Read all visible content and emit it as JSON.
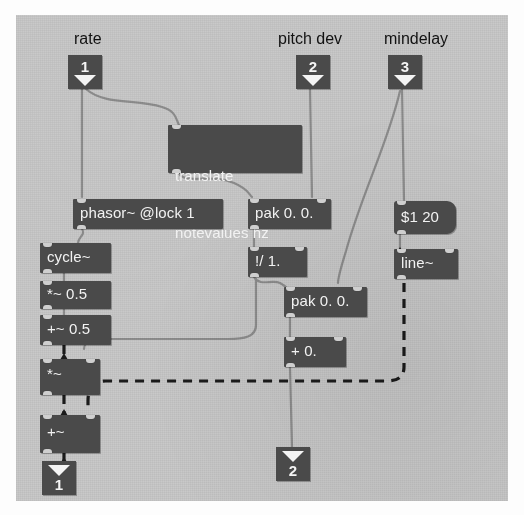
{
  "patch": {
    "title": "Max/MSP patcher",
    "canvas_color": "#c9c9c9",
    "object_color": "#4a4a4a",
    "text_color": "#f2f2f2",
    "comment_color": "#121212"
  },
  "comments": [
    {
      "name": "comment-rate",
      "text": "rate"
    },
    {
      "name": "comment-pitch-dev",
      "text": "pitch dev"
    },
    {
      "name": "comment-mindelay",
      "text": "mindelay"
    }
  ],
  "number_boxes": [
    {
      "name": "inlet-1-rate",
      "value": "1",
      "kind": "inlet"
    },
    {
      "name": "inlet-2-pitch-dev",
      "value": "2",
      "kind": "inlet"
    },
    {
      "name": "inlet-3-mindelay",
      "value": "3",
      "kind": "inlet"
    },
    {
      "name": "outlet-1",
      "value": "1",
      "kind": "outlet"
    },
    {
      "name": "outlet-2",
      "value": "2",
      "kind": "outlet"
    }
  ],
  "objects": [
    {
      "name": "object-translate-notevalues-hz",
      "line1": "translate",
      "line2": "notevalues hz",
      "kind": "object"
    },
    {
      "name": "object-phasor",
      "text": "phasor~ @lock 1",
      "kind": "object"
    },
    {
      "name": "object-pak-top",
      "text": "pak 0. 0.",
      "kind": "object"
    },
    {
      "name": "object-message-mindelay",
      "text": "$1 20",
      "kind": "message"
    },
    {
      "name": "object-cycle",
      "text": "cycle~",
      "kind": "object"
    },
    {
      "name": "object-divide-inverse",
      "text": "!/ 1.",
      "kind": "object"
    },
    {
      "name": "object-line",
      "text": "line~",
      "kind": "object"
    },
    {
      "name": "object-multiply-signal-half",
      "text": "*~ 0.5",
      "kind": "object"
    },
    {
      "name": "object-pak-bottom",
      "text": "pak 0. 0.",
      "kind": "object"
    },
    {
      "name": "object-add-signal-half",
      "text": "+~ 0.5",
      "kind": "object"
    },
    {
      "name": "object-add-zero",
      "text": "+ 0.",
      "kind": "object"
    },
    {
      "name": "object-multiply-signal",
      "text": "*~",
      "kind": "object"
    },
    {
      "name": "object-add-signal",
      "text": "+~",
      "kind": "object"
    }
  ],
  "connections": {
    "signal_style": "dashed-thick",
    "control_style": "solid-thin"
  }
}
